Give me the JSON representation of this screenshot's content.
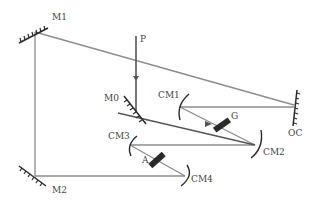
{
  "diagram": {
    "type": "optical laser cavity schematic",
    "labels": {
      "M1": "M1",
      "M2": "M2",
      "M0": "M0",
      "P": "P",
      "CM1": "CM1",
      "CM2": "CM2",
      "CM3": "CM3",
      "CM4": "CM4",
      "OC": "OC",
      "G": "G",
      "A": "A"
    },
    "colors": {
      "beam": "#8c8c8c",
      "pump": "#555555",
      "component": "#2a2a2a",
      "text": "#444444"
    }
  }
}
